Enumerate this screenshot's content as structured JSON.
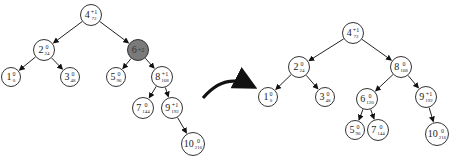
{
  "diagram": {
    "arrow_icon": "curved-right-arrow",
    "before": {
      "nodes": [
        {
          "id": "b4",
          "key": "4",
          "balance": "+1",
          "value": "72",
          "x": 91,
          "y": 15,
          "r": 11
        },
        {
          "id": "b2",
          "key": "2",
          "balance": "0",
          "value": "24",
          "x": 44,
          "y": 50,
          "r": 11
        },
        {
          "id": "b6",
          "key": "6",
          "balance": "+2",
          "value": "",
          "x": 138,
          "y": 50,
          "r": 11,
          "highlight": true
        },
        {
          "id": "b1",
          "key": "1",
          "balance": "0",
          "value": "0",
          "x": 11,
          "y": 77,
          "r": 10
        },
        {
          "id": "b3",
          "key": "3",
          "balance": "0",
          "value": "48",
          "x": 70,
          "y": 77,
          "r": 10
        },
        {
          "id": "b5",
          "key": "5",
          "balance": "0",
          "value": "96",
          "x": 116,
          "y": 77,
          "r": 10
        },
        {
          "id": "b8",
          "key": "8",
          "balance": "+1",
          "value": "168",
          "x": 162,
          "y": 77,
          "r": 11
        },
        {
          "id": "b7",
          "key": "7",
          "balance": "0",
          "value": "144",
          "x": 143,
          "y": 108,
          "r": 11
        },
        {
          "id": "b9",
          "key": "9",
          "balance": "+1",
          "value": "192",
          "x": 172,
          "y": 108,
          "r": 11
        },
        {
          "id": "b10",
          "key": "10",
          "balance": "0",
          "value": "216",
          "x": 193,
          "y": 144,
          "r": 12
        }
      ],
      "edges": [
        [
          "b4",
          "b2"
        ],
        [
          "b4",
          "b6"
        ],
        [
          "b2",
          "b1"
        ],
        [
          "b2",
          "b3"
        ],
        [
          "b6",
          "b5"
        ],
        [
          "b6",
          "b8"
        ],
        [
          "b8",
          "b7"
        ],
        [
          "b8",
          "b9"
        ],
        [
          "b9",
          "b10"
        ]
      ]
    },
    "after": {
      "nodes": [
        {
          "id": "a4",
          "key": "4",
          "balance": "+1",
          "value": "72",
          "x": 353,
          "y": 33,
          "r": 11
        },
        {
          "id": "a2",
          "key": "2",
          "balance": "0",
          "value": "24",
          "x": 299,
          "y": 67,
          "r": 11
        },
        {
          "id": "a8",
          "key": "8",
          "balance": "0",
          "value": "168",
          "x": 401,
          "y": 67,
          "r": 11
        },
        {
          "id": "a1",
          "key": "1",
          "balance": "0",
          "value": "0",
          "x": 268,
          "y": 97,
          "r": 10
        },
        {
          "id": "a3",
          "key": "3",
          "balance": "0",
          "value": "48",
          "x": 325,
          "y": 97,
          "r": 10
        },
        {
          "id": "a6",
          "key": "6",
          "balance": "0",
          "value": "120",
          "x": 367,
          "y": 99,
          "r": 11
        },
        {
          "id": "a9",
          "key": "9",
          "balance": "+1",
          "value": "192",
          "x": 426,
          "y": 97,
          "r": 11
        },
        {
          "id": "a5",
          "key": "5",
          "balance": "0",
          "value": "96",
          "x": 355,
          "y": 130,
          "r": 10
        },
        {
          "id": "a7",
          "key": "7",
          "balance": "0",
          "value": "144",
          "x": 378,
          "y": 130,
          "r": 11
        },
        {
          "id": "a10",
          "key": "10",
          "balance": "0",
          "value": "216",
          "x": 437,
          "y": 134,
          "r": 12
        }
      ],
      "edges": [
        [
          "a4",
          "a2"
        ],
        [
          "a4",
          "a8"
        ],
        [
          "a2",
          "a1"
        ],
        [
          "a2",
          "a3"
        ],
        [
          "a8",
          "a6"
        ],
        [
          "a8",
          "a9"
        ],
        [
          "a6",
          "a5"
        ],
        [
          "a6",
          "a7"
        ],
        [
          "a9",
          "a10"
        ]
      ]
    }
  }
}
